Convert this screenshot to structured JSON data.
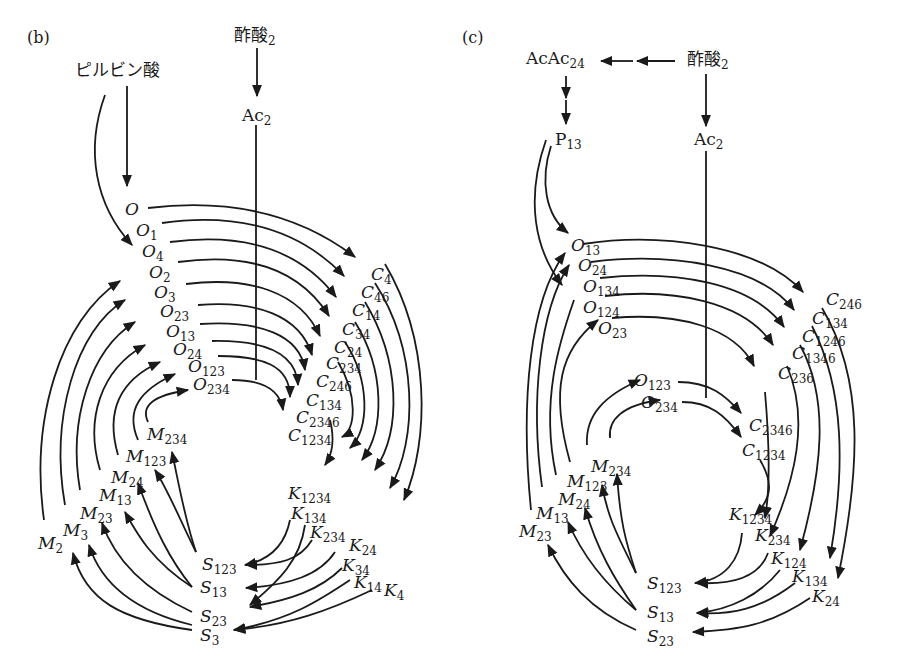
{
  "panels": [
    {
      "id": "b",
      "label": "(b)",
      "inputs": [
        {
          "id": "pyruvate",
          "text": "ピルビン酸",
          "sub": ""
        },
        {
          "id": "acetate",
          "text": "酢酸",
          "sub": "2"
        },
        {
          "id": "ac",
          "text": "Ac",
          "sub": "2"
        }
      ],
      "O_nodes": [
        {
          "base": "O",
          "sub": ""
        },
        {
          "base": "O",
          "sub": "1"
        },
        {
          "base": "O",
          "sub": "4"
        },
        {
          "base": "O",
          "sub": "2"
        },
        {
          "base": "O",
          "sub": "3"
        },
        {
          "base": "O",
          "sub": "23"
        },
        {
          "base": "O",
          "sub": "13"
        },
        {
          "base": "O",
          "sub": "24"
        },
        {
          "base": "O",
          "sub": "123"
        },
        {
          "base": "O",
          "sub": "234"
        }
      ],
      "C_nodes": [
        {
          "base": "C",
          "sub": "4"
        },
        {
          "base": "C",
          "sub": "46"
        },
        {
          "base": "C",
          "sub": "14"
        },
        {
          "base": "C",
          "sub": "34"
        },
        {
          "base": "C",
          "sub": "24"
        },
        {
          "base": "C",
          "sub": "234"
        },
        {
          "base": "C",
          "sub": "246"
        },
        {
          "base": "C",
          "sub": "134"
        },
        {
          "base": "C",
          "sub": "2346"
        },
        {
          "base": "C",
          "sub": "1234"
        }
      ],
      "K_nodes": [
        {
          "base": "K",
          "sub": "1234"
        },
        {
          "base": "K",
          "sub": "134"
        },
        {
          "base": "K",
          "sub": "234"
        },
        {
          "base": "K",
          "sub": "24"
        },
        {
          "base": "K",
          "sub": "34"
        },
        {
          "base": "K",
          "sub": "14"
        },
        {
          "base": "K",
          "sub": "4"
        }
      ],
      "S_nodes": [
        {
          "base": "S",
          "sub": "123"
        },
        {
          "base": "S",
          "sub": "13"
        },
        {
          "base": "S",
          "sub": "23"
        },
        {
          "base": "S",
          "sub": "3"
        }
      ],
      "M_nodes": [
        {
          "base": "M",
          "sub": "234"
        },
        {
          "base": "M",
          "sub": "123"
        },
        {
          "base": "M",
          "sub": "24"
        },
        {
          "base": "M",
          "sub": "13"
        },
        {
          "base": "M",
          "sub": "23"
        },
        {
          "base": "M",
          "sub": "3"
        },
        {
          "base": "M",
          "sub": "2"
        }
      ]
    },
    {
      "id": "c",
      "label": "(c)",
      "inputs": [
        {
          "id": "acac",
          "text": "AcAc",
          "sub": "24"
        },
        {
          "id": "acetate",
          "text": "酢酸",
          "sub": "2"
        },
        {
          "id": "p",
          "text": "P",
          "sub": "13"
        },
        {
          "id": "ac",
          "text": "Ac",
          "sub": "2"
        }
      ],
      "O_nodes": [
        {
          "base": "O",
          "sub": "13"
        },
        {
          "base": "O",
          "sub": "24"
        },
        {
          "base": "O",
          "sub": "134"
        },
        {
          "base": "O",
          "sub": "124"
        },
        {
          "base": "O",
          "sub": "23"
        },
        {
          "base": "O",
          "sub": "123"
        },
        {
          "base": "O",
          "sub": "234"
        }
      ],
      "C_nodes": [
        {
          "base": "C",
          "sub": "246"
        },
        {
          "base": "C",
          "sub": "134"
        },
        {
          "base": "C",
          "sub": "1246"
        },
        {
          "base": "C",
          "sub": "1346"
        },
        {
          "base": "C",
          "sub": "236"
        },
        {
          "base": "C",
          "sub": "2346"
        },
        {
          "base": "C",
          "sub": "1234"
        }
      ],
      "K_nodes": [
        {
          "base": "K",
          "sub": "1234"
        },
        {
          "base": "K",
          "sub": "234"
        },
        {
          "base": "K",
          "sub": "124"
        },
        {
          "base": "K",
          "sub": "134"
        },
        {
          "base": "K",
          "sub": "24"
        }
      ],
      "S_nodes": [
        {
          "base": "S",
          "sub": "123"
        },
        {
          "base": "S",
          "sub": "13"
        },
        {
          "base": "S",
          "sub": "23"
        }
      ],
      "M_nodes": [
        {
          "base": "M",
          "sub": "234"
        },
        {
          "base": "M",
          "sub": "123"
        },
        {
          "base": "M",
          "sub": "24"
        },
        {
          "base": "M",
          "sub": "13"
        },
        {
          "base": "M",
          "sub": "23"
        }
      ]
    }
  ]
}
